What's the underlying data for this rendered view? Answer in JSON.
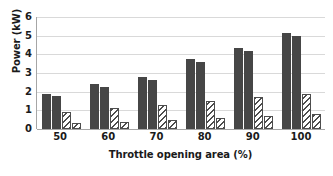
{
  "chart_data": {
    "type": "bar",
    "title": "",
    "xlabel": "Throttle opening area (%)",
    "ylabel": "Power (kW)",
    "categories": [
      "50",
      "60",
      "70",
      "80",
      "90",
      "100"
    ],
    "ylim": [
      0,
      6
    ],
    "yticks": [
      "0",
      "1",
      "2",
      "3",
      "4",
      "5",
      "6"
    ],
    "grid": true,
    "legend": "none",
    "series": [
      {
        "name": "series-1",
        "style": "solid",
        "color": "#464646",
        "values": [
          1.9,
          2.4,
          2.8,
          3.75,
          4.35,
          5.15
        ]
      },
      {
        "name": "series-2",
        "style": "solid",
        "color": "#464646",
        "values": [
          1.75,
          2.25,
          2.65,
          3.6,
          4.2,
          5.0
        ]
      },
      {
        "name": "series-3",
        "style": "hatched",
        "color": "#4d4d4d",
        "values": [
          0.9,
          1.1,
          1.3,
          1.5,
          1.7,
          1.9
        ]
      },
      {
        "name": "series-4",
        "style": "hatched",
        "color": "#4d4d4d",
        "values": [
          0.3,
          0.4,
          0.5,
          0.6,
          0.7,
          0.8
        ]
      }
    ]
  },
  "colors": {
    "bar_solid": "#464646",
    "bar_hatch_line": "#4d4d4d",
    "gridline": "#d9d9d9",
    "axis": "#a6a6a6",
    "text": "#1a1a1a",
    "background": "#ffffff"
  }
}
